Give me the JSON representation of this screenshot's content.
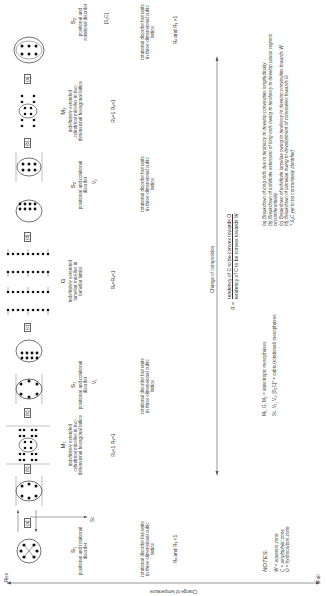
{
  "axes": {
    "temperature": {
      "label": "Change of temperature",
      "rise": "Rise",
      "fall": "Fall"
    },
    "composition": {
      "label": "Change of composition"
    }
  },
  "ratio_definition": {
    "lhs": "R =",
    "numerator": "tendency of C to be convex towards O",
    "denominator": "tendency of C to be convex towards W"
  },
  "phases": [
    {
      "id": "S1",
      "label": "S₁",
      "caption": "positional and rotational disorder",
      "lattice": "rotational disorder but units in three-dimensional cubic lattice",
      "ratio": "Rᵥ and Rᵧ <1",
      "exit": "Sᴄ"
    },
    {
      "id": "M1",
      "label": "M₁",
      "caption": "indefinitely extended cylindrical micelles in two-dimensional hexagonal lattice",
      "ratio": "Rᵥ<1 Rᵧ=1",
      "exit": "S₁"
    },
    {
      "id": "S1b",
      "label": "S₁",
      "caption": "positional and rotational disorder",
      "lattice": "rotational disorder but units in three-dimensional cubic lattice",
      "exit": "V₁"
    },
    {
      "id": "G",
      "label": "G",
      "caption": "indefinitely extended lamellar micelles in lamellar lattice",
      "ratio": "Rᵥ=Rᵧ=1",
      "exit": "S₁"
    },
    {
      "id": "S2",
      "label": "S₂",
      "caption": "positional and rotational disorder",
      "lattice": "rotational disorder but units in three-dimensional cubic lattice",
      "exit": "V₂"
    },
    {
      "id": "M2",
      "label": "M₂",
      "caption": "indefinitely extended cylindrical micelles in two-dimensional hexagonal lattice",
      "ratio": "Rᵥ=1 Rᵧ>1",
      "exit": "S₂"
    },
    {
      "id": "S2b",
      "label": "S₂",
      "caption": "positional and rotational disorder",
      "lattice": "rotational disorder but units in three-dimensional cubic lattice",
      "ratio": "Rᵥ and Rᵧ >1",
      "exit": "[S₂C]"
    }
  ],
  "transitions": [
    "(a)",
    "(b)",
    "(b)",
    "(c)",
    "(c)",
    "(d)",
    "(d)",
    "(b)",
    "(a)",
    "(a)"
  ],
  "zone_labels": {
    "W": "W",
    "C": "C",
    "O": "O"
  },
  "notes": {
    "title": "NOTES:",
    "zones": [
      "W = aqueous zone",
      "C = amphiphilic zone",
      "O = hydrocarbon zone"
    ],
    "phase_groups": [
      "M₁, G, M₂ = anisotropic mesophases",
      "Sᴄ, V₁, V₂, [S₂C]* = cubic (rotational) mesophases"
    ],
    "breakdowns": [
      "(a) Breakdown of long rods due to tendency to develop convexities longitudinally",
      "(b) Breakdown of indefinite extension of long rods owing to tendency to develop planar regions circumferentially",
      "(c) Breakdown of indefinite lamellae owing to tendency to develop convexities towards W",
      "(d) Breakdown of lamellae owing to development of convexities towards O",
      "* S₂C yet to be conclusively identified"
    ]
  }
}
